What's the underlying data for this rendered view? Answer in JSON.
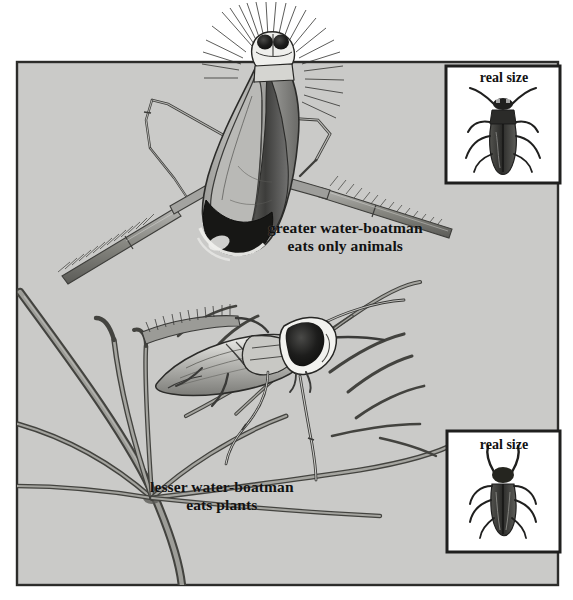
{
  "plate": {
    "kind": "natural-history-illustration",
    "title_caption_top": "greater water-boatman",
    "background_color": "#c9c9c7",
    "panel_border_color": "#2a2a28",
    "page_color": "#ffffff",
    "ink_color": "#1a1a1a"
  },
  "panel": {
    "x": 17,
    "y": 62,
    "width": 541,
    "height": 523
  },
  "captions": {
    "greater": {
      "line1": "greater water-boatman",
      "line2": "eats only animals"
    },
    "lesser": {
      "line1": "lesser water-boatman",
      "line2": "eats plants"
    }
  },
  "insets": [
    {
      "name": "inset-top",
      "label": "real size",
      "subject": "greater-water-boatman-actual-size",
      "x": 446,
      "y": 66,
      "width": 114,
      "height": 117
    },
    {
      "name": "inset-bottom",
      "label": "real size",
      "subject": "lesser-water-boatman-actual-size",
      "x": 447,
      "y": 431,
      "width": 113,
      "height": 121
    }
  ],
  "subjects": [
    {
      "name": "greater-water-boatman",
      "common_name": "greater water-boatman",
      "diet": "eats only animals",
      "orientation": "head-up, ventral view, swimming at surface",
      "features": [
        "fringed oar-like hind legs",
        "two dark eyes",
        "fan of bristles on head",
        "dark banded abdomen tip"
      ]
    },
    {
      "name": "lesser-water-boatman",
      "common_name": "lesser water-boatman",
      "diet": "eats plants",
      "orientation": "facing right, perched on pondweed stems",
      "features": [
        "large dark eye patch",
        "fringed swimming leg",
        "slender jointed legs",
        "pale head"
      ]
    }
  ],
  "plant": {
    "name": "pondweed-whorl",
    "description": "whorl of slender stems radiating from a node on a thick vertical stem"
  },
  "colors": {
    "panel_bg": "#c9c9c7",
    "ink_dark": "#1b1b1a",
    "ink_mid": "#6d6d6b",
    "ink_light": "#a9a9a6",
    "body_fill_light": "#b5b5b2",
    "body_fill_mid": "#8b8b88",
    "body_fill_dark": "#3a3a38",
    "white": "#f4f4f2"
  }
}
